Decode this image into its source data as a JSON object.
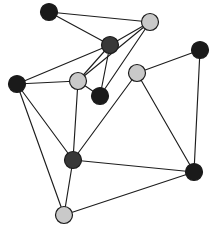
{
  "figure": {
    "background_color": "#ffffff",
    "width": 214,
    "height": 231
  },
  "palette": {
    "node_dark": "#1a1a1a",
    "node_medium": "#383838",
    "node_light": "#c9c9c9",
    "node_outline": "#1b1b1b",
    "edge_color": "#1d1d1d"
  },
  "graph_data": {
    "type": "node-link-diagram",
    "node_count": 11,
    "edge_count": 21,
    "node_radius": 8.5,
    "nodes": [
      {
        "id": "n0",
        "label": "",
        "x": 49,
        "y": 12,
        "color": "#1a1a1a",
        "shade": "dark"
      },
      {
        "id": "n1",
        "label": "",
        "x": 150,
        "y": 22,
        "color": "#c9c9c9",
        "shade": "light"
      },
      {
        "id": "n2",
        "label": "",
        "x": 110,
        "y": 45,
        "color": "#383838",
        "shade": "medium"
      },
      {
        "id": "n3",
        "label": "",
        "x": 200,
        "y": 50,
        "color": "#1a1a1a",
        "shade": "dark"
      },
      {
        "id": "n4",
        "label": "",
        "x": 137,
        "y": 73,
        "color": "#c9c9c9",
        "shade": "light"
      },
      {
        "id": "n5",
        "label": "",
        "x": 78,
        "y": 81,
        "color": "#c9c9c9",
        "shade": "light"
      },
      {
        "id": "n6",
        "label": "",
        "x": 17,
        "y": 84,
        "color": "#1a1a1a",
        "shade": "dark"
      },
      {
        "id": "n7",
        "label": "",
        "x": 100,
        "y": 96,
        "color": "#1a1a1a",
        "shade": "dark"
      },
      {
        "id": "n8",
        "label": "",
        "x": 73,
        "y": 160,
        "color": "#383838",
        "shade": "medium"
      },
      {
        "id": "n9",
        "label": "",
        "x": 194,
        "y": 172,
        "color": "#1a1a1a",
        "shade": "dark"
      },
      {
        "id": "n10",
        "label": "",
        "x": 64,
        "y": 215,
        "color": "#c9c9c9",
        "shade": "light"
      }
    ],
    "edges": [
      {
        "source": "n0",
        "target": "n1"
      },
      {
        "source": "n0",
        "target": "n2"
      },
      {
        "source": "n1",
        "target": "n2"
      },
      {
        "source": "n1",
        "target": "n5"
      },
      {
        "source": "n1",
        "target": "n7"
      },
      {
        "source": "n2",
        "target": "n5"
      },
      {
        "source": "n2",
        "target": "n6"
      },
      {
        "source": "n2",
        "target": "n7"
      },
      {
        "source": "n3",
        "target": "n4"
      },
      {
        "source": "n3",
        "target": "n9"
      },
      {
        "source": "n4",
        "target": "n8"
      },
      {
        "source": "n4",
        "target": "n9"
      },
      {
        "source": "n5",
        "target": "n6"
      },
      {
        "source": "n5",
        "target": "n7"
      },
      {
        "source": "n5",
        "target": "n8"
      },
      {
        "source": "n6",
        "target": "n8"
      },
      {
        "source": "n6",
        "target": "n10"
      },
      {
        "source": "n8",
        "target": "n9"
      },
      {
        "source": "n8",
        "target": "n10"
      },
      {
        "source": "n9",
        "target": "n10"
      },
      {
        "source": "n6",
        "target": "n5"
      }
    ]
  }
}
